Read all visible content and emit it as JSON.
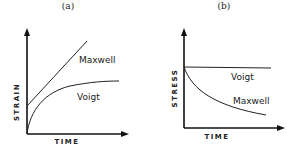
{
  "panels": [
    {
      "id": "a",
      "title": "(a)",
      "ylabel": "STRAIN",
      "xlabel": "TIME",
      "curves": [
        {
          "name": "Maxwell",
          "label": "Maxwell",
          "shape": "linear increase from initial offset"
        },
        {
          "name": "Voigt",
          "label": "Voigt",
          "shape": "rising curve approaching asymptote from origin"
        }
      ]
    },
    {
      "id": "b",
      "title": "(b)",
      "ylabel": "STRESS",
      "xlabel": "TIME",
      "curves": [
        {
          "name": "Voigt",
          "label": "Voigt",
          "shape": "constant horizontal line"
        },
        {
          "name": "Maxwell",
          "label": "Maxwell",
          "shape": "exponential decay from initial value"
        }
      ]
    }
  ],
  "colors": {
    "line": "#222222",
    "background": "#ffffff"
  }
}
